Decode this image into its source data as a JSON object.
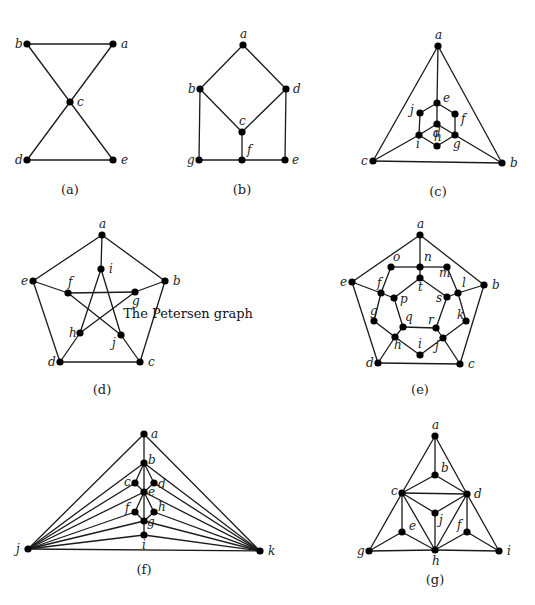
{
  "figure": {
    "annotation": "The Petersen graph",
    "annotation_pos": [
      188,
      318
    ]
  },
  "graphs": [
    {
      "id": "a",
      "caption": "(a)",
      "caption_pos": [
        70,
        194
      ],
      "nodes": [
        {
          "id": "b",
          "x": 27,
          "y": 44,
          "lx": -12,
          "ly": 4
        },
        {
          "id": "a",
          "x": 113,
          "y": 44,
          "lx": 8,
          "ly": 4
        },
        {
          "id": "c",
          "x": 70,
          "y": 102,
          "lx": 7,
          "ly": 4
        },
        {
          "id": "d",
          "x": 27,
          "y": 160,
          "lx": -12,
          "ly": 4
        },
        {
          "id": "e",
          "x": 113,
          "y": 160,
          "lx": 8,
          "ly": 4
        }
      ],
      "edges": [
        [
          "b",
          "a"
        ],
        [
          "b",
          "c"
        ],
        [
          "a",
          "c"
        ],
        [
          "c",
          "d"
        ],
        [
          "c",
          "e"
        ],
        [
          "d",
          "e"
        ]
      ]
    },
    {
      "id": "b",
      "caption": "(b)",
      "caption_pos": [
        242,
        194
      ],
      "nodes": [
        {
          "id": "a",
          "x": 243,
          "y": 45,
          "lx": -3,
          "ly": -7
        },
        {
          "id": "b",
          "x": 200,
          "y": 89,
          "lx": -12,
          "ly": 4
        },
        {
          "id": "d",
          "x": 286,
          "y": 89,
          "lx": 7,
          "ly": 4
        },
        {
          "id": "c",
          "x": 242,
          "y": 132,
          "lx": -3,
          "ly": -7
        },
        {
          "id": "g",
          "x": 199,
          "y": 160,
          "lx": -12,
          "ly": 4
        },
        {
          "id": "f",
          "x": 242,
          "y": 160,
          "lx": 5,
          "ly": -6
        },
        {
          "id": "e",
          "x": 285,
          "y": 160,
          "lx": 7,
          "ly": 4
        }
      ],
      "edges": [
        [
          "a",
          "b"
        ],
        [
          "a",
          "d"
        ],
        [
          "b",
          "c"
        ],
        [
          "d",
          "c"
        ],
        [
          "b",
          "g"
        ],
        [
          "d",
          "e"
        ],
        [
          "c",
          "f"
        ],
        [
          "g",
          "f"
        ],
        [
          "f",
          "e"
        ]
      ]
    },
    {
      "id": "c",
      "caption": "(c)",
      "caption_pos": [
        438,
        196
      ],
      "nodes": [
        {
          "id": "a",
          "x": 438,
          "y": 46,
          "lx": -3,
          "ly": -7
        },
        {
          "id": "e",
          "x": 437,
          "y": 103,
          "lx": 6,
          "ly": -1
        },
        {
          "id": "j",
          "x": 420,
          "y": 113,
          "lx": -10,
          "ly": 1
        },
        {
          "id": "f",
          "x": 455,
          "y": 114,
          "lx": 6,
          "ly": 9
        },
        {
          "id": "d",
          "x": 437,
          "y": 124,
          "lx": -4,
          "ly": 13
        },
        {
          "id": "i",
          "x": 419,
          "y": 135,
          "lx": -3,
          "ly": 13
        },
        {
          "id": "g",
          "x": 455,
          "y": 135,
          "lx": -2,
          "ly": 13
        },
        {
          "id": "h",
          "x": 437,
          "y": 146,
          "lx": -3,
          "ly": -5
        },
        {
          "id": "c",
          "x": 373,
          "y": 161,
          "lx": -12,
          "ly": 4
        },
        {
          "id": "b",
          "x": 502,
          "y": 163,
          "lx": 8,
          "ly": 4
        }
      ],
      "edges": [
        [
          "a",
          "c"
        ],
        [
          "a",
          "b"
        ],
        [
          "c",
          "b"
        ],
        [
          "a",
          "e"
        ],
        [
          "e",
          "j"
        ],
        [
          "e",
          "f"
        ],
        [
          "j",
          "i"
        ],
        [
          "f",
          "g"
        ],
        [
          "e",
          "d"
        ],
        [
          "d",
          "i"
        ],
        [
          "d",
          "g"
        ],
        [
          "i",
          "h"
        ],
        [
          "g",
          "h"
        ],
        [
          "i",
          "c"
        ],
        [
          "g",
          "b"
        ]
      ]
    },
    {
      "id": "d",
      "caption": "(d)",
      "caption_pos": [
        102,
        394
      ],
      "nodes": [
        {
          "id": "a",
          "x": 102,
          "y": 235,
          "lx": -3,
          "ly": -7
        },
        {
          "id": "i",
          "x": 101,
          "y": 269,
          "lx": 8,
          "ly": 4
        },
        {
          "id": "e",
          "x": 33,
          "y": 281,
          "lx": -12,
          "ly": 4
        },
        {
          "id": "b",
          "x": 165,
          "y": 281,
          "lx": 8,
          "ly": 4
        },
        {
          "id": "f",
          "x": 68,
          "y": 293,
          "lx": 0,
          "ly": -7
        },
        {
          "id": "g",
          "x": 135,
          "y": 292,
          "lx": -3,
          "ly": 13
        },
        {
          "id": "h",
          "x": 80,
          "y": 333,
          "lx": -11,
          "ly": 4
        },
        {
          "id": "j",
          "x": 121,
          "y": 335,
          "lx": -9,
          "ly": 12
        },
        {
          "id": "d",
          "x": 60,
          "y": 362,
          "lx": -12,
          "ly": 4
        },
        {
          "id": "c",
          "x": 140,
          "y": 362,
          "lx": 8,
          "ly": 4
        }
      ],
      "edges": [
        [
          "a",
          "b"
        ],
        [
          "b",
          "c"
        ],
        [
          "c",
          "d"
        ],
        [
          "d",
          "e"
        ],
        [
          "e",
          "a"
        ],
        [
          "a",
          "i"
        ],
        [
          "b",
          "g"
        ],
        [
          "c",
          "j"
        ],
        [
          "d",
          "h"
        ],
        [
          "e",
          "f"
        ],
        [
          "i",
          "h"
        ],
        [
          "i",
          "j"
        ],
        [
          "f",
          "g"
        ],
        [
          "f",
          "j"
        ],
        [
          "g",
          "h"
        ]
      ]
    },
    {
      "id": "e",
      "caption": "(e)",
      "caption_pos": [
        420,
        394
      ],
      "nodes": [
        {
          "id": "a",
          "x": 420,
          "y": 235,
          "lx": -3,
          "ly": -7
        },
        {
          "id": "b",
          "x": 484,
          "y": 285,
          "lx": 8,
          "ly": 4
        },
        {
          "id": "c",
          "x": 460,
          "y": 364,
          "lx": 8,
          "ly": 4
        },
        {
          "id": "d",
          "x": 378,
          "y": 363,
          "lx": -12,
          "ly": 4
        },
        {
          "id": "e",
          "x": 352,
          "y": 282,
          "lx": -12,
          "ly": 4
        },
        {
          "id": "o",
          "x": 391,
          "y": 267,
          "lx": 2,
          "ly": -6
        },
        {
          "id": "n",
          "x": 420,
          "y": 267,
          "lx": 4,
          "ly": -6
        },
        {
          "id": "m",
          "x": 447,
          "y": 267,
          "lx": -8,
          "ly": 10
        },
        {
          "id": "t",
          "x": 420,
          "y": 278,
          "lx": -2,
          "ly": 13
        },
        {
          "id": "f",
          "x": 381,
          "y": 293,
          "lx": -4,
          "ly": -6
        },
        {
          "id": "p",
          "x": 394,
          "y": 298,
          "lx": 6,
          "ly": 5
        },
        {
          "id": "s",
          "x": 447,
          "y": 297,
          "lx": -11,
          "ly": 5
        },
        {
          "id": "l",
          "x": 458,
          "y": 293,
          "lx": 4,
          "ly": -6
        },
        {
          "id": "g",
          "x": 374,
          "y": 321,
          "lx": -4,
          "ly": -6
        },
        {
          "id": "k",
          "x": 466,
          "y": 321,
          "lx": -9,
          "ly": -2
        },
        {
          "id": "q",
          "x": 403,
          "y": 327,
          "lx": 2,
          "ly": -6
        },
        {
          "id": "r",
          "x": 436,
          "y": 328,
          "lx": -8,
          "ly": -4
        },
        {
          "id": "h",
          "x": 395,
          "y": 337,
          "lx": -1,
          "ly": 12
        },
        {
          "id": "j",
          "x": 443,
          "y": 338,
          "lx": -8,
          "ly": 12
        },
        {
          "id": "i",
          "x": 420,
          "y": 355,
          "lx": -2,
          "ly": -7
        }
      ],
      "edges": [
        [
          "a",
          "b"
        ],
        [
          "b",
          "c"
        ],
        [
          "c",
          "d"
        ],
        [
          "d",
          "e"
        ],
        [
          "e",
          "a"
        ],
        [
          "a",
          "n"
        ],
        [
          "b",
          "l"
        ],
        [
          "c",
          "j"
        ],
        [
          "d",
          "h"
        ],
        [
          "e",
          "f"
        ],
        [
          "n",
          "o"
        ],
        [
          "o",
          "f"
        ],
        [
          "f",
          "g"
        ],
        [
          "g",
          "h"
        ],
        [
          "h",
          "i"
        ],
        [
          "i",
          "j"
        ],
        [
          "j",
          "k"
        ],
        [
          "k",
          "l"
        ],
        [
          "l",
          "m"
        ],
        [
          "m",
          "n"
        ],
        [
          "n",
          "t"
        ],
        [
          "f",
          "p"
        ],
        [
          "h",
          "q"
        ],
        [
          "j",
          "r"
        ],
        [
          "l",
          "s"
        ],
        [
          "t",
          "p"
        ],
        [
          "p",
          "q"
        ],
        [
          "q",
          "r"
        ],
        [
          "r",
          "s"
        ],
        [
          "s",
          "t"
        ]
      ]
    },
    {
      "id": "f",
      "caption": "(f)",
      "caption_pos": [
        144,
        574
      ],
      "nodes": [
        {
          "id": "a",
          "x": 144,
          "y": 434,
          "lx": 7,
          "ly": 4
        },
        {
          "id": "b",
          "x": 144,
          "y": 463,
          "lx": 4,
          "ly": 1
        },
        {
          "id": "c",
          "x": 135,
          "y": 483,
          "lx": -11,
          "ly": 3
        },
        {
          "id": "d",
          "x": 154,
          "y": 483,
          "lx": 4,
          "ly": 5
        },
        {
          "id": "e",
          "x": 144,
          "y": 492,
          "lx": 4,
          "ly": 4
        },
        {
          "id": "f",
          "x": 135,
          "y": 512,
          "lx": -10,
          "ly": 0
        },
        {
          "id": "h",
          "x": 154,
          "y": 512,
          "lx": 4,
          "ly": -1
        },
        {
          "id": "g",
          "x": 144,
          "y": 521,
          "lx": 3,
          "ly": 5
        },
        {
          "id": "i",
          "x": 144,
          "y": 535,
          "lx": -2,
          "ly": 14
        },
        {
          "id": "j",
          "x": 28,
          "y": 549,
          "lx": -12,
          "ly": 4
        },
        {
          "id": "k",
          "x": 260,
          "y": 551,
          "lx": 8,
          "ly": 4
        }
      ],
      "edges": [
        [
          "a",
          "b"
        ],
        [
          "a",
          "j"
        ],
        [
          "a",
          "k"
        ],
        [
          "b",
          "c"
        ],
        [
          "b",
          "d"
        ],
        [
          "b",
          "e"
        ],
        [
          "c",
          "e"
        ],
        [
          "d",
          "e"
        ],
        [
          "e",
          "f"
        ],
        [
          "e",
          "h"
        ],
        [
          "e",
          "g"
        ],
        [
          "f",
          "g"
        ],
        [
          "h",
          "g"
        ],
        [
          "g",
          "i"
        ],
        [
          "j",
          "k"
        ],
        [
          "j",
          "b"
        ],
        [
          "j",
          "c"
        ],
        [
          "j",
          "e"
        ],
        [
          "j",
          "f"
        ],
        [
          "j",
          "g"
        ],
        [
          "j",
          "i"
        ],
        [
          "k",
          "b"
        ],
        [
          "k",
          "d"
        ],
        [
          "k",
          "e"
        ],
        [
          "k",
          "h"
        ],
        [
          "k",
          "g"
        ],
        [
          "k",
          "i"
        ]
      ]
    },
    {
      "id": "g",
      "caption": "(g)",
      "caption_pos": [
        435,
        584
      ],
      "nodes": [
        {
          "id": "a",
          "x": 435,
          "y": 436,
          "lx": -3,
          "ly": -7
        },
        {
          "id": "b",
          "x": 435,
          "y": 475,
          "lx": 6,
          "ly": -3
        },
        {
          "id": "c",
          "x": 402,
          "y": 493,
          "lx": -11,
          "ly": 2
        },
        {
          "id": "d",
          "x": 467,
          "y": 494,
          "lx": 7,
          "ly": 4
        },
        {
          "id": "j",
          "x": 435,
          "y": 513,
          "lx": 4,
          "ly": 11
        },
        {
          "id": "e",
          "x": 402,
          "y": 532,
          "lx": 7,
          "ly": -2
        },
        {
          "id": "f",
          "x": 467,
          "y": 532,
          "lx": -10,
          "ly": -3
        },
        {
          "id": "g",
          "x": 369,
          "y": 551,
          "lx": -12,
          "ly": 4
        },
        {
          "id": "h",
          "x": 435,
          "y": 550,
          "lx": -3,
          "ly": 15
        },
        {
          "id": "i",
          "x": 499,
          "y": 551,
          "lx": 8,
          "ly": 4
        }
      ],
      "edges": [
        [
          "a",
          "b"
        ],
        [
          "a",
          "c"
        ],
        [
          "a",
          "d"
        ],
        [
          "b",
          "c"
        ],
        [
          "b",
          "d"
        ],
        [
          "c",
          "d"
        ],
        [
          "c",
          "j"
        ],
        [
          "d",
          "j"
        ],
        [
          "j",
          "h"
        ],
        [
          "c",
          "e"
        ],
        [
          "c",
          "h"
        ],
        [
          "c",
          "g"
        ],
        [
          "e",
          "g"
        ],
        [
          "e",
          "h"
        ],
        [
          "d",
          "f"
        ],
        [
          "d",
          "h"
        ],
        [
          "d",
          "i"
        ],
        [
          "f",
          "h"
        ],
        [
          "f",
          "i"
        ],
        [
          "g",
          "h"
        ],
        [
          "h",
          "i"
        ]
      ]
    }
  ]
}
